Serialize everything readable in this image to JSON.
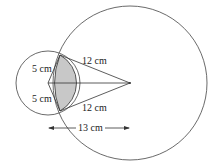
{
  "diagram": {
    "type": "two intersecting circles with shaded lens",
    "small_circle": {
      "cx": 48,
      "cy": 83,
      "r": 32
    },
    "large_circle": {
      "cx": 130,
      "cy": 83,
      "r": 77
    },
    "intersection_top": {
      "x": 60,
      "y": 55
    },
    "intersection_bottom": {
      "x": 60,
      "y": 111
    },
    "shade_color": "#c8c8c8",
    "stroke_color": "#333333",
    "labels": {
      "small_radius_top": "5 cm",
      "small_radius_bottom": "5 cm",
      "large_radius_top": "12 cm",
      "large_radius_bottom": "12 cm",
      "center_distance": "13 cm"
    }
  }
}
